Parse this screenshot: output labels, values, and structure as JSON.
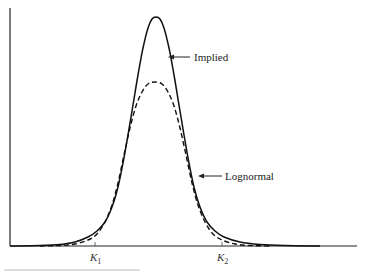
{
  "chart_data": {
    "type": "line",
    "title": "",
    "xlabel": "",
    "ylabel": "",
    "grid": false,
    "legend_position": "annotations",
    "x_ticks": [
      {
        "label": "K",
        "sub": "1",
        "px": 95
      },
      {
        "label": "K",
        "sub": "2",
        "px": 222
      }
    ],
    "series": [
      {
        "name": "Implied",
        "style": "solid",
        "description": "Implied distribution — sharper peak, heavier tails",
        "points_px": [
          [
            10,
            246
          ],
          [
            40,
            245.5
          ],
          [
            60,
            244.5
          ],
          [
            75,
            242
          ],
          [
            88,
            237
          ],
          [
            97,
            231
          ],
          [
            105,
            222
          ],
          [
            112,
            207
          ],
          [
            118,
            187
          ],
          [
            123,
            163
          ],
          [
            128,
            135
          ],
          [
            133,
            105
          ],
          [
            138,
            75
          ],
          [
            143,
            48
          ],
          [
            148,
            28
          ],
          [
            152,
            19
          ],
          [
            156,
            17
          ],
          [
            160,
            19
          ],
          [
            164,
            28
          ],
          [
            169,
            48
          ],
          [
            174,
            75
          ],
          [
            179,
            105
          ],
          [
            184,
            135
          ],
          [
            189,
            163
          ],
          [
            194,
            187
          ],
          [
            200,
            207
          ],
          [
            207,
            222
          ],
          [
            215,
            231
          ],
          [
            224,
            237
          ],
          [
            240,
            242
          ],
          [
            260,
            244.5
          ],
          [
            285,
            245.5
          ],
          [
            320,
            246
          ]
        ]
      },
      {
        "name": "Lognormal",
        "style": "dashed",
        "description": "Lognormal distribution — lower, wider peak, thinner tails",
        "points_px": [
          [
            40,
            246
          ],
          [
            60,
            245.5
          ],
          [
            75,
            244
          ],
          [
            88,
            240
          ],
          [
            97,
            234
          ],
          [
            105,
            222
          ],
          [
            112,
            205
          ],
          [
            118,
            183
          ],
          [
            124,
            155
          ],
          [
            130,
            128
          ],
          [
            136,
            106
          ],
          [
            142,
            92
          ],
          [
            148,
            84
          ],
          [
            155,
            82
          ],
          [
            162,
            84
          ],
          [
            168,
            92
          ],
          [
            174,
            106
          ],
          [
            180,
            128
          ],
          [
            186,
            155
          ],
          [
            192,
            183
          ],
          [
            198,
            205
          ],
          [
            205,
            222
          ],
          [
            213,
            234
          ],
          [
            222,
            240
          ],
          [
            235,
            244
          ],
          [
            250,
            245.5
          ],
          [
            270,
            246
          ]
        ]
      }
    ],
    "annotations": [
      {
        "text": "Implied",
        "arrow_from": [
          190,
          57
        ],
        "arrow_to": [
          168,
          57
        ],
        "text_x": 194,
        "text_y": 61
      },
      {
        "text": "Lognormal",
        "arrow_from": [
          222,
          176
        ],
        "arrow_to": [
          198,
          176
        ],
        "text_x": 225,
        "text_y": 180
      }
    ],
    "axes_px": {
      "origin": [
        10,
        246
      ],
      "y_top": 8,
      "x_right": 357
    }
  }
}
